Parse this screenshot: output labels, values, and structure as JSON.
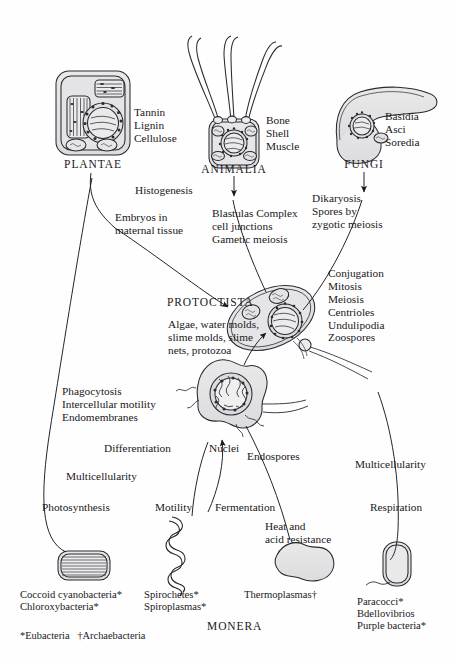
{
  "diagram": {
    "ink_color": "#1a1820",
    "cell_fill": "#e2e2e4",
    "background": "#fefefe"
  },
  "kingdoms": {
    "plantae": {
      "name": "PLANTAE",
      "traits": "Tannin\nLignin\nCellulose"
    },
    "animalia": {
      "name": "ANIMALIA",
      "traits": "Bone\nShell\nMuscle"
    },
    "fungi": {
      "name": "FUNGI",
      "traits": "Basidia\nAsci\nSoredia"
    },
    "protoctista": {
      "name": "PROTOCTISTA",
      "members": "Algae, water molds,\nslime molds, slime\nnets, protozoa",
      "traits": "Conjugation\nMitosis\nMeiosis\nCentrioles\nUndulipodia\nZoospores"
    },
    "monera": {
      "name": "MONERA"
    }
  },
  "transitions": {
    "histogenesis": "Histogenesis",
    "embryos": "Embryos in\nmaternal tissue",
    "blastulas": "Blastulas Complex\ncell junctions\nGametic meiosis",
    "dikaryosis": "Dikaryosis\nSpores by\nzygotic meiosis",
    "phagocytosis": "Phagocytosis\nIntercellular motility\nEndomembranes",
    "differentiation": "Differentiation",
    "nuclei": "Nuclei",
    "endospores": "Endospores",
    "multicellularity_left": "Multicellularity",
    "multicellularity_right": "Multicellularity",
    "photosynthesis": "Photosynthesis",
    "motility": "Motility",
    "fermentation": "Fermentation",
    "respiration": "Respiration",
    "heat_acid": "Heat and\nacid resistance"
  },
  "monera_organisms": {
    "cyanobacteria": "Coccoid cyanobacteria*\nChloroxybacteria*",
    "spirochetes": "Spirochetes*\nSpiroplasmas*",
    "thermoplasmas": "Thermoplasmas†",
    "paracocci": "Paracocci*\nBdellovibrios\nPurple bacteria*"
  },
  "footnotes": {
    "legend": "*Eubacteria   †Archaebacteria"
  }
}
